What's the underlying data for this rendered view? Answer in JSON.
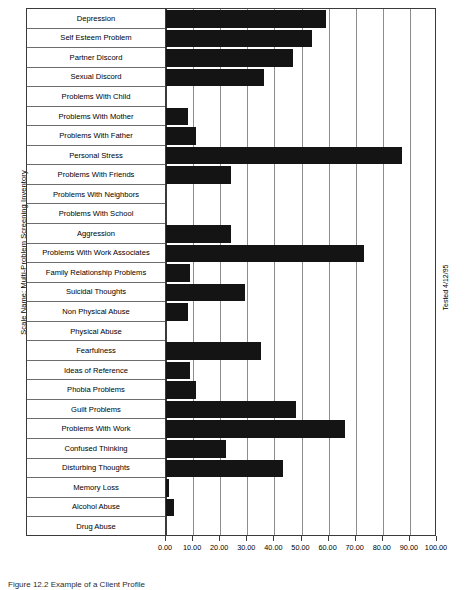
{
  "figure": {
    "ylabel": "Scale Name: Multi-Problem Screening Inventory",
    "right_note": "Tested 4/12/95",
    "caption": "Figure 12.2   Example of a Client Profile"
  },
  "chart_data": {
    "type": "bar",
    "orientation": "horizontal",
    "title": "",
    "xlabel": "",
    "ylabel": "Scale Name: Multi-Problem Screening Inventory",
    "xlim": [
      0,
      100
    ],
    "xticks": [
      0,
      10,
      20,
      30,
      40,
      50,
      60,
      70,
      80,
      90,
      100
    ],
    "xticklabels": [
      "0.00",
      "10.00",
      "20.00",
      "30.00",
      "40.00",
      "50.00",
      "60.00",
      "70.00",
      "80.00",
      "90.00",
      "100.00"
    ],
    "grid": true,
    "legend": null,
    "bar_color": "#141414",
    "annotation": "Tested 4/12/95",
    "categories": [
      "Depression",
      "Self Esteem Problem",
      "Partner Discord",
      "Sexual Discord",
      "Problems With Child",
      "Problems With Mother",
      "Problems With Father",
      "Personal Stress",
      "Problems With Friends",
      "Problems With Neighbors",
      "Problems With School",
      "Aggression",
      "Problems With Work Associates",
      "Family Relationship Problems",
      "Suicidal Thoughts",
      "Non Physical Abuse",
      "Physical Abuse",
      "Fearfulness",
      "Ideas of Reference",
      "Phobia Problems",
      "Guilt Problems",
      "Problems With Work",
      "Confused Thinking",
      "Disturbing Thoughts",
      "Memory Loss",
      "Alcohol Abuse",
      "Drug Abuse"
    ],
    "values": [
      59,
      54,
      47,
      36,
      0,
      8,
      11,
      87,
      24,
      0,
      0,
      24,
      73,
      9,
      29,
      8,
      0,
      35,
      9,
      11,
      48,
      66,
      22,
      43,
      1,
      3,
      0
    ]
  }
}
